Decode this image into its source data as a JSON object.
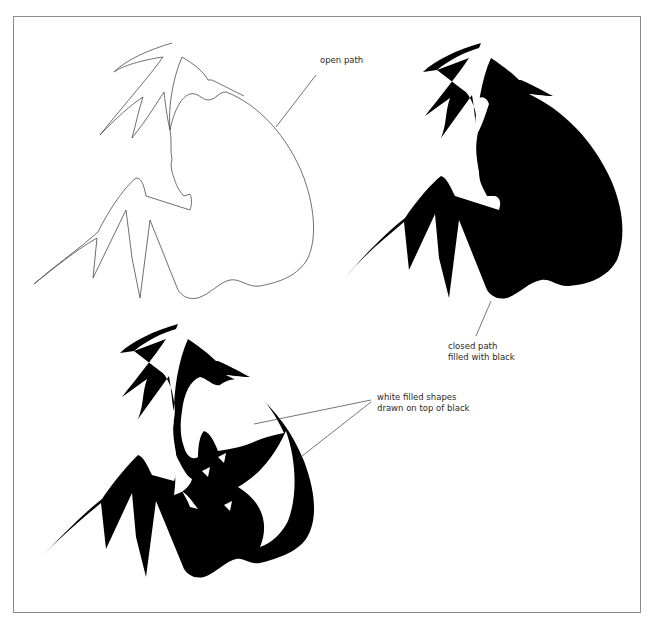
{
  "figure": {
    "frame": {
      "border_color": "#8a8a8a"
    },
    "panels": [
      {
        "id": "open-path",
        "caption_lines": [
          "open path"
        ],
        "style": "outline"
      },
      {
        "id": "closed-path",
        "caption_lines": [
          "closed path",
          "filled with black"
        ],
        "style": "black-fill",
        "fill_color": "#000000"
      },
      {
        "id": "white-shapes",
        "caption_lines": [
          "white filled shapes",
          "drawn on top of black"
        ],
        "style": "black-fill-with-white-overlays",
        "fill_color": "#000000",
        "overlay_color": "#ffffff"
      }
    ]
  }
}
